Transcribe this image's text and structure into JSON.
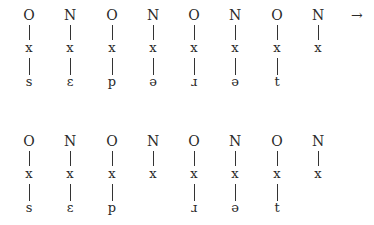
{
  "diagram": {
    "rows": [
      {
        "columns": [
          {
            "node": "O",
            "x": "x",
            "segment": "s"
          },
          {
            "node": "N",
            "x": "x",
            "segment": "ɛ"
          },
          {
            "node": "O",
            "x": "x",
            "segment": "p"
          },
          {
            "node": "N",
            "x": "x",
            "segment": "ə"
          },
          {
            "node": "O",
            "x": "x",
            "segment": "ɹ"
          },
          {
            "node": "N",
            "x": "x",
            "segment": "ə"
          },
          {
            "node": "O",
            "x": "x",
            "segment": "t"
          },
          {
            "node": "N",
            "x": "x",
            "segment": ""
          }
        ],
        "arrow": "→"
      },
      {
        "columns": [
          {
            "node": "O",
            "x": "x",
            "segment": "s"
          },
          {
            "node": "N",
            "x": "x",
            "segment": "ɛ"
          },
          {
            "node": "O",
            "x": "x",
            "segment": "p"
          },
          {
            "node": "N",
            "x": "x",
            "segment": ""
          },
          {
            "node": "O",
            "x": "x",
            "segment": "ɹ"
          },
          {
            "node": "N",
            "x": "x",
            "segment": "ə"
          },
          {
            "node": "O",
            "x": "x",
            "segment": "t"
          },
          {
            "node": "N",
            "x": "x",
            "segment": ""
          }
        ]
      }
    ]
  }
}
